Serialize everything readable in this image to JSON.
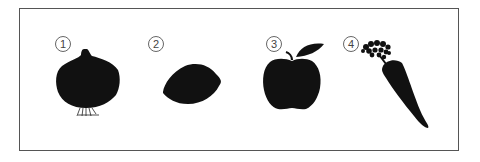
{
  "figure": {
    "items": [
      {
        "number": "1",
        "label": "onion"
      },
      {
        "number": "2",
        "label": "lemon"
      },
      {
        "number": "3",
        "label": "apple"
      },
      {
        "number": "4",
        "label": "carrot"
      }
    ],
    "fill_color": "#111111",
    "border_color": "#555555"
  }
}
